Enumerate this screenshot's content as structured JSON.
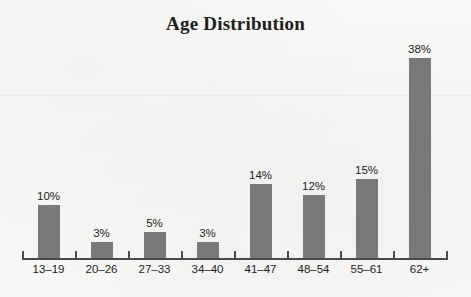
{
  "chart_data": {
    "type": "bar",
    "title": "Age Distribution",
    "xlabel": "",
    "ylabel": "",
    "ylim": [
      0,
      40
    ],
    "grid": false,
    "legend": null,
    "value_suffix": "%",
    "categories": [
      "13–19",
      "20–26",
      "27–33",
      "34–40",
      "41–47",
      "48–54",
      "55–61",
      "62+"
    ],
    "values": [
      10,
      3,
      5,
      3,
      14,
      12,
      15,
      38
    ],
    "data_labels": [
      "10%",
      "3%",
      "5%",
      "3%",
      "14%",
      "12%",
      "15%",
      "38%"
    ],
    "bar_color": "#797977",
    "axis_color": "#4a4a48",
    "text_color": "#1d1c1a",
    "background_color": "#f7f7f5"
  }
}
